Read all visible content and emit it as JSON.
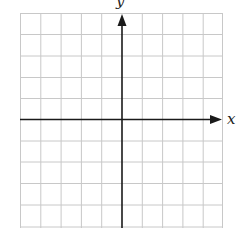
{
  "diagram": {
    "type": "coordinate-plane",
    "grid": {
      "columns": 10,
      "rows": 10,
      "color": "#c8c8c8"
    },
    "axes": {
      "color": "#1a1a1a",
      "x_label": "x",
      "y_label": "y"
    }
  }
}
